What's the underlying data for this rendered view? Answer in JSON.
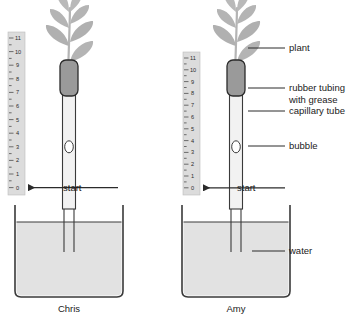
{
  "diagram": {
    "background_color": "#ffffff",
    "line_color": "#3a3a3a",
    "plant_color": "#b4b4b4",
    "water_color": "#e2e2e2",
    "ruler_color": "#dcdcdc",
    "rubber_color": "#9a9a9a",
    "tube_fill": "#f2f2f2"
  },
  "setups": [
    {
      "id": "left",
      "name": "Chris",
      "start_label": "start",
      "ruler": {
        "ticks": [
          "11",
          "10",
          "9",
          "8",
          "7",
          "6",
          "5",
          "4",
          "3",
          "2",
          "1",
          "0"
        ],
        "min": 0,
        "max": 11
      },
      "bubble_position": 4
    },
    {
      "id": "right",
      "name": "Amy",
      "start_label": "start",
      "ruler": {
        "ticks": [
          "11",
          "10",
          "9",
          "8",
          "7",
          "6",
          "5",
          "4",
          "3",
          "2",
          "1",
          "0"
        ],
        "min": 0,
        "max": 11
      },
      "bubble_position": 4
    }
  ],
  "callouts": [
    {
      "id": "plant",
      "text": "plant"
    },
    {
      "id": "rubber-tubing",
      "text": "rubber tubing with grease"
    },
    {
      "id": "capillary-tube",
      "text": "capillary tube"
    },
    {
      "id": "bubble",
      "text": "bubble"
    },
    {
      "id": "water",
      "text": "water"
    }
  ],
  "icons": {
    "arrow": "arrow-left-icon",
    "leaf": "leaf-icon"
  }
}
